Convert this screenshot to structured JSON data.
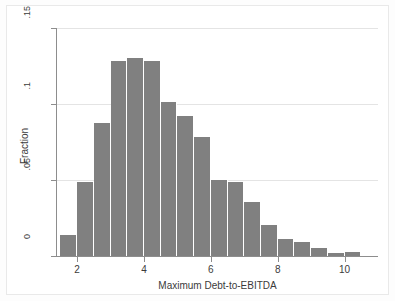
{
  "chart_data": {
    "type": "bar",
    "title": "",
    "subtitle": "",
    "xlabel": "Maximum Debt-to-EBITDA",
    "ylabel": "Fraction",
    "grid": true,
    "legend": null,
    "bar_color": "#808080",
    "bin_width": 0.5,
    "xlim": [
      1.4,
      11.0
    ],
    "ylim": [
      0,
      0.15
    ],
    "xticks": [
      2,
      4,
      6,
      8,
      10
    ],
    "xtick_labels": [
      "2",
      "4",
      "6",
      "8",
      "10"
    ],
    "yticks": [
      0,
      0.05,
      0.1,
      0.15
    ],
    "ytick_labels": [
      "0",
      ".05",
      ".1",
      ".15"
    ],
    "categories": [
      "1.5-2.0",
      "2.0-2.5",
      "2.5-3.0",
      "3.0-3.5",
      "3.5-4.0",
      "4.0-4.5",
      "4.5-5.0",
      "5.0-5.5",
      "5.5-6.0",
      "6.0-6.5",
      "6.5-7.0",
      "7.0-7.5",
      "7.5-8.0",
      "8.0-8.5",
      "8.5-9.0",
      "9.0-9.5",
      "9.5-10.0",
      "10.0-10.5"
    ],
    "bin_starts": [
      1.5,
      2.0,
      2.5,
      3.0,
      3.5,
      4.0,
      4.5,
      5.0,
      5.5,
      6.0,
      6.5,
      7.0,
      7.5,
      8.0,
      8.5,
      9.0,
      9.5,
      10.0
    ],
    "values": [
      0.0135,
      0.0485,
      0.0875,
      0.1285,
      0.1305,
      0.128,
      0.1015,
      0.092,
      0.078,
      0.05,
      0.0487,
      0.0355,
      0.0205,
      0.011,
      0.009,
      0.0055,
      0.0022,
      0.0025
    ],
    "annotations": []
  },
  "figure": {
    "axis_color": "#8d8d8d",
    "grid_color": "#e4e4e4",
    "background": "#ffffff"
  }
}
